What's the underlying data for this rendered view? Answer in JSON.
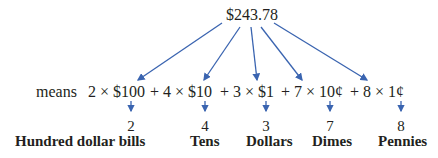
{
  "total": "$243.78",
  "expression": {
    "prefix": "means",
    "terms": [
      {
        "text": "2 × $100"
      },
      {
        "text": "+ 4 × $10"
      },
      {
        "text": "+ 3 × $1"
      },
      {
        "text": "+ 7 × 10¢"
      },
      {
        "text": "+ 8 × 1¢"
      }
    ]
  },
  "places": [
    {
      "digit": "2",
      "label": "Hundred dollar bills"
    },
    {
      "digit": "4",
      "label": "Tens"
    },
    {
      "digit": "3",
      "label": "Dollars"
    },
    {
      "digit": "7",
      "label": "Dimes"
    },
    {
      "digit": "8",
      "label": "Pennies"
    }
  ],
  "colors": {
    "arrow": "#3a64b0",
    "text": "#231f20"
  }
}
